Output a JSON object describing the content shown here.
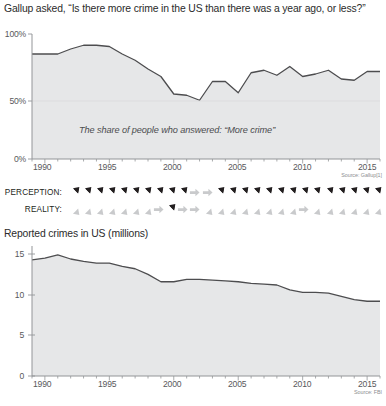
{
  "headline": "Gallup asked, “Is there more crime in the US than there was a year ago, or less?”",
  "top_chart": {
    "annotation": "The share of people who answered: “More crime”",
    "source": "Source: Gallup[1]",
    "y_ticks": [
      "100%",
      "50%",
      "0%"
    ],
    "x_ticks": [
      "1990",
      "1995",
      "2000",
      "2005",
      "2010",
      "2015"
    ]
  },
  "perception_row": {
    "label": "PERCEPTION:",
    "arrows": [
      "up",
      "up",
      "up",
      "up",
      "up",
      "up",
      "up",
      "up",
      "up",
      "up",
      "right",
      "right",
      "up",
      "up",
      "up",
      "up",
      "up",
      "up",
      "up",
      "up",
      "up",
      "up",
      "up",
      "up",
      "up",
      "up"
    ]
  },
  "reality_row": {
    "label": "REALITY:",
    "arrows": [
      "down",
      "down",
      "down",
      "down",
      "down",
      "down",
      "down",
      "right",
      "up",
      "right",
      "right",
      "down",
      "down",
      "down",
      "down",
      "down",
      "down",
      "down",
      "down",
      "right",
      "down",
      "down",
      "down",
      "down",
      "down",
      "down"
    ]
  },
  "bottom_chart": {
    "subtitle": "Reported crimes in US (millions)",
    "source": "Source: FBI",
    "y_ticks": [
      "15",
      "10",
      "5",
      "0"
    ],
    "x_ticks": [
      "1990",
      "1995",
      "2000",
      "2005",
      "2010",
      "2015"
    ]
  },
  "colors": {
    "area_fill": "#e6e7e8",
    "line": "#4d4d4f",
    "axis": "#939598",
    "text": "#231f20",
    "arrow_dark": "#231f20",
    "arrow_light": "#c9cacc"
  },
  "chart_data": [
    {
      "type": "area",
      "title": "Gallup asked, “Is there more crime in the US than there was a year ago, or less?”",
      "subtitle": "The share of people who answered: “More crime”",
      "xlabel": "",
      "ylabel": "",
      "ylim": [
        0,
        100
      ],
      "xlim": [
        1989,
        2016
      ],
      "grid": false,
      "legend": null,
      "source": "Source: Gallup[1]",
      "x": [
        1989,
        1990,
        1991,
        1992,
        1993,
        1994,
        1995,
        1996,
        1997,
        1998,
        1999,
        2000,
        2001,
        2002,
        2003,
        2004,
        2005,
        2006,
        2007,
        2008,
        2009,
        2010,
        2011,
        2012,
        2013,
        2014,
        2015,
        2016
      ],
      "values": [
        84,
        84,
        84,
        88,
        91,
        91,
        90,
        84,
        79,
        72,
        66,
        52,
        51,
        47,
        62,
        62,
        53,
        69,
        71,
        67,
        74,
        66,
        68,
        71,
        64,
        63,
        70,
        70
      ]
    },
    {
      "type": "area",
      "title": "Reported crimes in US (millions)",
      "xlabel": "",
      "ylabel": "millions",
      "ylim": [
        0,
        16
      ],
      "xlim": [
        1989,
        2016
      ],
      "grid": false,
      "legend": null,
      "source": "Source: FBI",
      "x": [
        1989,
        1990,
        1991,
        1992,
        1993,
        1994,
        1995,
        1996,
        1997,
        1998,
        1999,
        2000,
        2001,
        2002,
        2003,
        2004,
        2005,
        2006,
        2007,
        2008,
        2009,
        2010,
        2011,
        2012,
        2013,
        2014,
        2015,
        2016
      ],
      "values": [
        14.3,
        14.5,
        14.9,
        14.4,
        14.1,
        13.9,
        13.9,
        13.5,
        13.2,
        12.5,
        11.6,
        11.6,
        11.9,
        11.9,
        11.8,
        11.7,
        11.6,
        11.4,
        11.3,
        11.2,
        10.6,
        10.3,
        10.3,
        10.2,
        9.8,
        9.4,
        9.2,
        9.2
      ]
    }
  ]
}
